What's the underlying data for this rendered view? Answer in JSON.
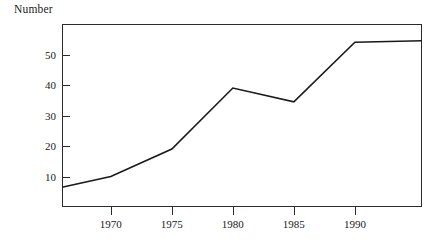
{
  "chart_data": {
    "type": "line",
    "title": "",
    "ylabel": "Number",
    "xlabel": "",
    "grid": false,
    "legend": "none",
    "xlim": [
      1966.0,
      1995.5
    ],
    "ylim": [
      0,
      60
    ],
    "x_ticks": [
      1970,
      1975,
      1980,
      1985,
      1990
    ],
    "x_tick_labels": [
      "1970",
      "1975",
      "1980",
      "1985",
      "1990"
    ],
    "y_ticks": [
      10,
      20,
      30,
      40,
      50
    ],
    "y_tick_labels": [
      "10",
      "20",
      "30",
      "40",
      "50"
    ],
    "series": [
      {
        "name": "Number",
        "color": "#1a1a1a",
        "x": [
          1966.0,
          1970,
          1975,
          1980,
          1985,
          1990,
          1995.5
        ],
        "values": [
          6.5,
          10,
          19,
          39,
          34.5,
          54,
          54.5
        ]
      }
    ]
  },
  "axes": {
    "y_axis_caption": "Number"
  },
  "style": {
    "line_color": "#1a1a1a",
    "frame_color": "#2b2b2b",
    "text_color": "#1a1a1a",
    "background": "#ffffff"
  }
}
